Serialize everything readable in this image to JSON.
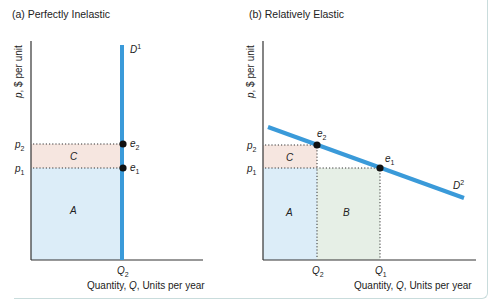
{
  "panels": [
    {
      "title": "(a) Perfectly Inelastic",
      "y_axis_label": "p, $ per unit",
      "x_axis_label": "Quantity, Q, Units per year",
      "curve_label": "D",
      "curve_sup": "1",
      "price_labels": [
        {
          "main": "p",
          "sub": "2"
        },
        {
          "main": "p",
          "sub": "1"
        }
      ],
      "points": [
        {
          "main": "e",
          "sub": "2"
        },
        {
          "main": "e",
          "sub": "1"
        }
      ],
      "quantity_labels": [
        {
          "main": "Q",
          "sub": "2"
        }
      ],
      "regions": [
        "C",
        "A"
      ]
    },
    {
      "title": "(b) Relatively Elastic",
      "y_axis_label": "p, $ per unit",
      "x_axis_label": "Quantity, Q, Units per year",
      "curve_label": "D",
      "curve_sup": "2",
      "price_labels": [
        {
          "main": "p",
          "sub": "2"
        },
        {
          "main": "p",
          "sub": "1"
        }
      ],
      "points": [
        {
          "main": "e",
          "sub": "2"
        },
        {
          "main": "e",
          "sub": "1"
        }
      ],
      "quantity_labels": [
        {
          "main": "Q",
          "sub": "2"
        },
        {
          "main": "Q",
          "sub": "1"
        }
      ],
      "regions": [
        "C",
        "A",
        "B"
      ]
    }
  ],
  "colors": {
    "demand_curve": "#3a9ad9",
    "region_c": "#f6e6e0",
    "region_a": "#dcedf8",
    "region_b": "#e6efe6",
    "axis": "#333333",
    "frame": "#c9dcdc"
  }
}
